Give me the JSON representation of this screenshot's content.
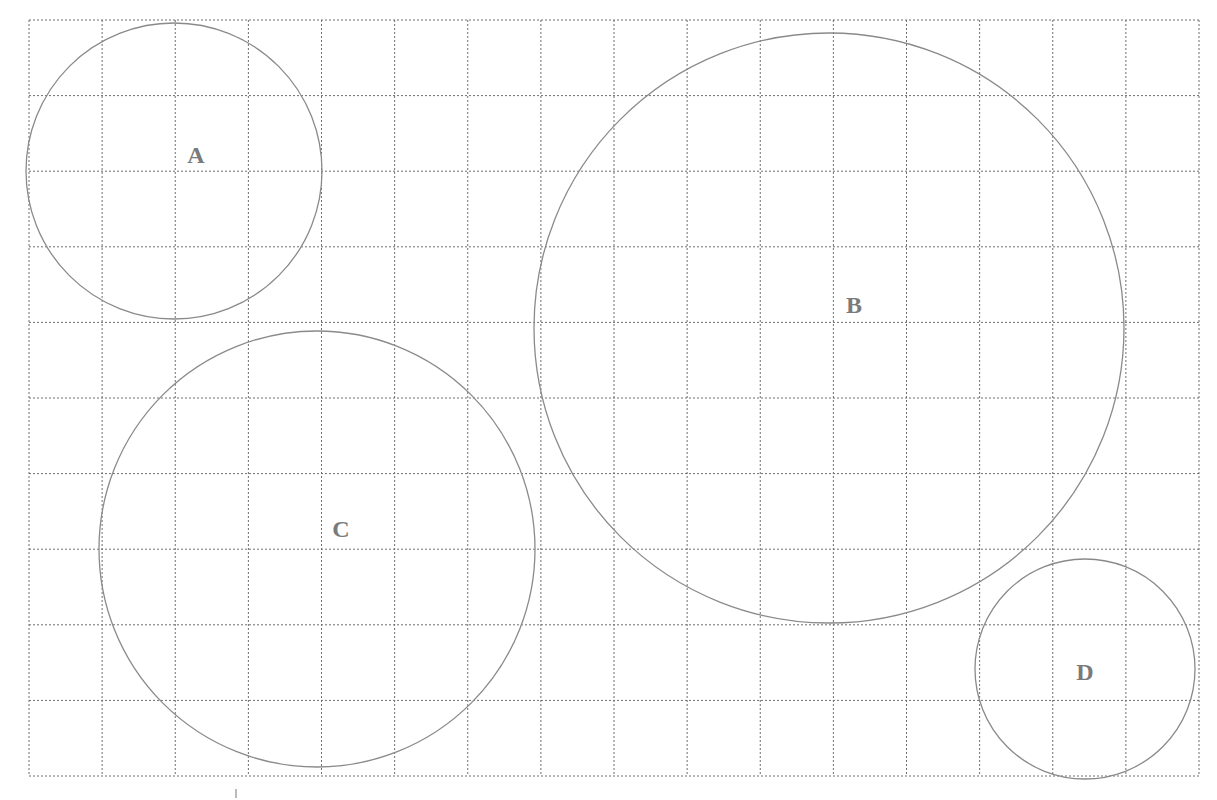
{
  "diagram": {
    "grid": {
      "x0": 29,
      "y0": 20,
      "x1": 1199,
      "y1": 776,
      "columns": 16,
      "rows": 10,
      "line_color": "#6e6e6e",
      "line_style": "dotted"
    },
    "circles": [
      {
        "id": "A",
        "label": "A",
        "cx": 174,
        "cy": 171,
        "r": 148,
        "label_x": 196,
        "label_y": 163
      },
      {
        "id": "B",
        "label": "B",
        "cx": 829,
        "cy": 328,
        "r": 295,
        "label_x": 854,
        "label_y": 313
      },
      {
        "id": "C",
        "label": "C",
        "cx": 317,
        "cy": 549,
        "r": 218,
        "label_x": 341,
        "label_y": 537
      },
      {
        "id": "D",
        "label": "D",
        "cx": 1085,
        "cy": 669,
        "r": 110,
        "label_x": 1085,
        "label_y": 680
      }
    ],
    "circle_stroke": "#8a8a8a",
    "tick_mark": {
      "x": 236,
      "y1": 789,
      "y2": 798
    }
  }
}
